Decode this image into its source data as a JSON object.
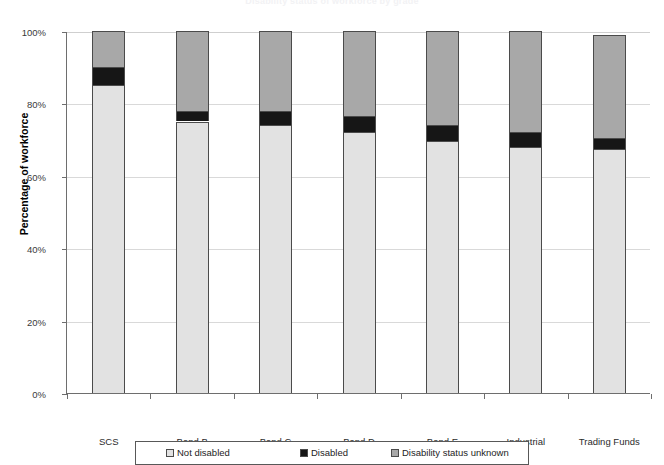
{
  "chart_data": {
    "type": "bar",
    "subtype": "stacked-percentage-column",
    "title": "Disability status of workforce by grade",
    "xlabel": "",
    "ylabel": "Percentage of workforce",
    "ylim": [
      0,
      100
    ],
    "ytick_labels": [
      "0%",
      "20%",
      "40%",
      "60%",
      "80%",
      "100%"
    ],
    "ytick_values": [
      0,
      20,
      40,
      60,
      80,
      100
    ],
    "grid": true,
    "legend_position": "bottom",
    "categories": [
      "SCS",
      "Band B",
      "Band C",
      "Band D",
      "Band E",
      "Industrial",
      "Trading Funds"
    ],
    "series": [
      {
        "name": "Not disabled",
        "color": "#e2e2e2",
        "values": [
          85,
          75,
          74,
          72,
          69.5,
          68,
          67.5
        ]
      },
      {
        "name": "Disabled",
        "color": "#161616",
        "values": [
          5,
          3,
          4,
          4.5,
          4.5,
          4,
          3
        ]
      },
      {
        "name": "Disability status unknown",
        "color": "#a8a8a8",
        "values": [
          10,
          22,
          22,
          23.5,
          26,
          28,
          28.5
        ]
      }
    ]
  },
  "axis": {
    "y_title": "Percentage of workforce"
  },
  "legend": {
    "items": [
      {
        "label": "Not disabled",
        "color": "#e2e2e2"
      },
      {
        "label": "Disabled",
        "color": "#161616"
      },
      {
        "label": "Disability status unknown",
        "color": "#a8a8a8"
      }
    ]
  }
}
